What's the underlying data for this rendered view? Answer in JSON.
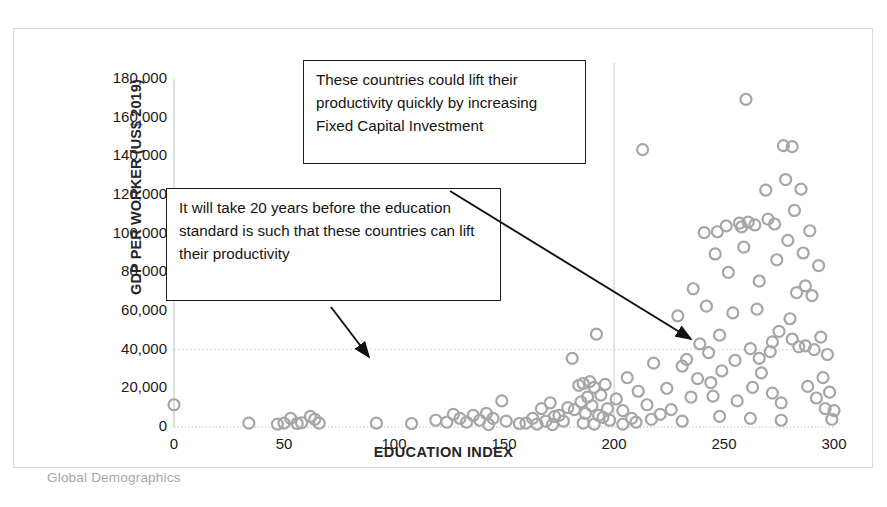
{
  "chart_data": {
    "type": "scatter",
    "title": "",
    "xlabel": "EDUCATION INDEX",
    "ylabel": "GDP PER WORKER  (US$ 2019)",
    "xlim": [
      0,
      300
    ],
    "ylim": [
      0,
      180000
    ],
    "xticks": [
      0,
      50,
      100,
      150,
      200,
      250,
      300
    ],
    "xtick_labels": [
      "0",
      "50",
      "100",
      "150",
      "200",
      "250",
      "300"
    ],
    "yticks": [
      0,
      20000,
      40000,
      60000,
      80000,
      100000,
      120000,
      140000,
      160000,
      180000
    ],
    "ytick_labels": [
      "0",
      "20,000",
      "40,000",
      "60,000",
      "80,000",
      "100,000",
      "120,000",
      "140,000",
      "160,000",
      "180,000"
    ],
    "grid": "reference-lines-only",
    "legend": "none",
    "marker": {
      "shape": "circle-open",
      "edge_color": "#a6a6a6",
      "fill_color": "none",
      "size_px": 11
    },
    "reference_lines": [
      {
        "orientation": "vertical",
        "value": 200,
        "color": "#c9c9c9",
        "style": "solid"
      },
      {
        "orientation": "horizontal",
        "value": 40000,
        "color": "#c9c9c9",
        "style": "dotted"
      }
    ],
    "points": [
      [
        0,
        11500
      ],
      [
        34,
        2000
      ],
      [
        47,
        1500
      ],
      [
        50,
        2000
      ],
      [
        53,
        4500
      ],
      [
        56,
        1800
      ],
      [
        58,
        2200
      ],
      [
        62,
        5500
      ],
      [
        64,
        4000
      ],
      [
        66,
        2000
      ],
      [
        92,
        2000
      ],
      [
        108,
        1800
      ],
      [
        119,
        3500
      ],
      [
        124,
        2500
      ],
      [
        127,
        6500
      ],
      [
        130,
        4500
      ],
      [
        133,
        2500
      ],
      [
        136,
        6000
      ],
      [
        139,
        3500
      ],
      [
        142,
        7000
      ],
      [
        145,
        4500
      ],
      [
        149,
        13500
      ],
      [
        151,
        3000
      ],
      [
        160,
        2000
      ],
      [
        163,
        4500
      ],
      [
        165,
        1500
      ],
      [
        167,
        9500
      ],
      [
        169,
        3000
      ],
      [
        171,
        12500
      ],
      [
        173,
        5500
      ],
      [
        175,
        6000
      ],
      [
        177,
        3000
      ],
      [
        179,
        10000
      ],
      [
        181,
        35500
      ],
      [
        182,
        9000
      ],
      [
        184,
        21500
      ],
      [
        185,
        13000
      ],
      [
        186,
        22500
      ],
      [
        187,
        7000
      ],
      [
        188,
        15500
      ],
      [
        189,
        23500
      ],
      [
        190,
        11000
      ],
      [
        191,
        20500
      ],
      [
        192,
        48000
      ],
      [
        193,
        6000
      ],
      [
        194,
        16500
      ],
      [
        195,
        5000
      ],
      [
        196,
        22000
      ],
      [
        197,
        9500
      ],
      [
        198,
        3500
      ],
      [
        201,
        14500
      ],
      [
        204,
        8500
      ],
      [
        206,
        25500
      ],
      [
        208,
        4500
      ],
      [
        211,
        18500
      ],
      [
        213,
        143500
      ],
      [
        215,
        11500
      ],
      [
        218,
        33000
      ],
      [
        221,
        6500
      ],
      [
        224,
        20000
      ],
      [
        226,
        9000
      ],
      [
        229,
        57500
      ],
      [
        231,
        31500
      ],
      [
        233,
        35000
      ],
      [
        235,
        15500
      ],
      [
        236,
        71500
      ],
      [
        238,
        25000
      ],
      [
        239,
        43000
      ],
      [
        241,
        100500
      ],
      [
        242,
        62500
      ],
      [
        243,
        38500
      ],
      [
        244,
        23000
      ],
      [
        245,
        16000
      ],
      [
        246,
        89500
      ],
      [
        247,
        101000
      ],
      [
        248,
        47500
      ],
      [
        249,
        29000
      ],
      [
        251,
        104000
      ],
      [
        252,
        80000
      ],
      [
        254,
        59000
      ],
      [
        255,
        34500
      ],
      [
        256,
        13500
      ],
      [
        257,
        105500
      ],
      [
        258,
        103500
      ],
      [
        259,
        93000
      ],
      [
        260,
        169500
      ],
      [
        261,
        106000
      ],
      [
        262,
        40500
      ],
      [
        263,
        20500
      ],
      [
        264,
        104500
      ],
      [
        265,
        61000
      ],
      [
        266,
        75500
      ],
      [
        267,
        28000
      ],
      [
        269,
        122500
      ],
      [
        270,
        107500
      ],
      [
        271,
        39000
      ],
      [
        272,
        17500
      ],
      [
        273,
        105000
      ],
      [
        274,
        86500
      ],
      [
        275,
        49500
      ],
      [
        276,
        12500
      ],
      [
        277,
        145500
      ],
      [
        278,
        128000
      ],
      [
        279,
        96500
      ],
      [
        280,
        56000
      ],
      [
        281,
        145000
      ],
      [
        282,
        112000
      ],
      [
        283,
        69500
      ],
      [
        284,
        41500
      ],
      [
        285,
        123000
      ],
      [
        286,
        90000
      ],
      [
        287,
        42000
      ],
      [
        288,
        21000
      ],
      [
        289,
        101500
      ],
      [
        290,
        68000
      ],
      [
        291,
        40000
      ],
      [
        292,
        15000
      ],
      [
        293,
        83500
      ],
      [
        294,
        46500
      ],
      [
        295,
        25500
      ],
      [
        296,
        9500
      ],
      [
        297,
        37500
      ],
      [
        298,
        18000
      ],
      [
        299,
        4000
      ],
      [
        300,
        8500
      ],
      [
        204,
        1500
      ],
      [
        210,
        2500
      ],
      [
        217,
        4000
      ],
      [
        172,
        1200
      ],
      [
        186,
        2000
      ],
      [
        191,
        1500
      ],
      [
        143,
        1200
      ],
      [
        157,
        1800
      ],
      [
        231,
        3000
      ],
      [
        248,
        5500
      ],
      [
        262,
        4500
      ],
      [
        276,
        3500
      ],
      [
        266,
        35500
      ],
      [
        281,
        45500
      ],
      [
        287,
        73000
      ],
      [
        272,
        44000
      ]
    ]
  },
  "annotations": {
    "callout_capital": {
      "text": "These countries could lift their productivity quickly by increasing  Fixed Capital Investment"
    },
    "callout_education": {
      "text": "It will take 20 years before the education standard is such that these countries can lift their productivity"
    },
    "arrows": [
      {
        "name": "arrow-to-capital-cluster",
        "from": [
          450,
          191
        ],
        "to": [
          691,
          339
        ]
      },
      {
        "name": "arrow-to-education-cluster",
        "from": [
          331,
          307
        ],
        "to": [
          369,
          357
        ]
      }
    ]
  },
  "source": {
    "label": "Global Demographics"
  }
}
